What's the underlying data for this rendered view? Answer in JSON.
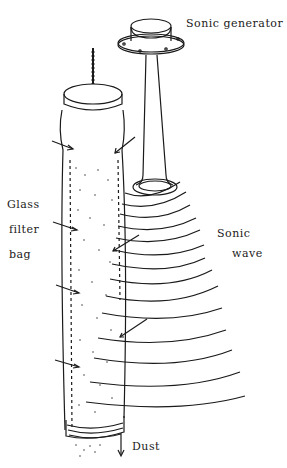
{
  "diagram": {
    "labels": {
      "sonic_generator": "Sonic generator",
      "glass_filter_bag_line1": "Glass",
      "glass_filter_bag_line2": "filter",
      "glass_filter_bag_line3": "bag",
      "sonic_wave_line1": "Sonic",
      "sonic_wave_line2": "wave",
      "dust": "Dust"
    },
    "components": [
      {
        "name": "sonic-generator",
        "label": "Sonic generator"
      },
      {
        "name": "sonic-horn",
        "label": ""
      },
      {
        "name": "glass-filter-bag",
        "label": "Glass filter bag"
      },
      {
        "name": "sonic-waves",
        "label": "Sonic wave",
        "count": 14
      },
      {
        "name": "dust-discharge",
        "label": "Dust"
      }
    ],
    "colors": {
      "ink": "#1a1a1a",
      "background": "#ffffff"
    }
  }
}
